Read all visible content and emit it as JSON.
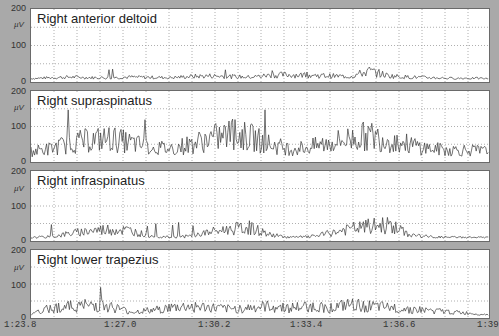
{
  "chart_data": {
    "type": "line",
    "title": "",
    "xlabel": "",
    "ylabel": "µV",
    "x_ticks": [
      "1:23.8",
      "1:27.0",
      "1:30.2",
      "1:33.4",
      "1:36.6",
      "1:39"
    ],
    "ylim": [
      0,
      200
    ],
    "y_ticks": [
      "0",
      "100",
      "200"
    ],
    "grid": true,
    "series": [
      {
        "name": "Right anterior deltoid",
        "baseline": 5,
        "envelope": [
          5,
          8,
          10,
          8,
          8,
          10,
          9,
          8,
          12,
          14,
          12,
          10,
          16,
          18,
          16,
          14,
          12,
          30,
          14,
          10,
          8,
          6,
          6,
          5
        ],
        "peak": 35
      },
      {
        "name": "Right supraspinatus",
        "baseline": 40,
        "envelope": [
          30,
          40,
          60,
          70,
          75,
          60,
          45,
          40,
          55,
          75,
          90,
          80,
          55,
          40,
          45,
          60,
          75,
          85,
          70,
          55,
          40,
          35,
          35,
          30
        ],
        "peak": 180
      },
      {
        "name": "Right infraspinatus",
        "baseline": 5,
        "envelope": [
          5,
          8,
          20,
          30,
          35,
          30,
          10,
          6,
          10,
          25,
          35,
          40,
          15,
          6,
          8,
          20,
          35,
          45,
          50,
          15,
          8,
          6,
          6,
          5
        ],
        "peak": 60
      },
      {
        "name": "Right lower trapezius",
        "baseline": 15,
        "envelope": [
          5,
          30,
          35,
          40,
          35,
          15,
          20,
          30,
          35,
          30,
          25,
          30,
          35,
          30,
          35,
          30,
          40,
          35,
          30,
          25,
          20,
          15,
          10,
          5
        ],
        "peak": 95
      }
    ]
  },
  "panels": [
    {
      "title": "Right anterior deltoid",
      "y200": "200",
      "unit": "µV",
      "y100": "100",
      "y0": "0"
    },
    {
      "title": "Right supraspinatus",
      "y200": "200",
      "unit": "µV",
      "y100": "100",
      "y0": "0"
    },
    {
      "title": "Right infraspinatus",
      "y200": "200",
      "unit": "µV",
      "y100": "100",
      "y0": "0"
    },
    {
      "title": "Right lower trapezius",
      "y200": "200",
      "unit": "µV",
      "y100": "100",
      "y0": "0"
    }
  ],
  "x_axis": {
    "ticks": [
      "1:23.8",
      "1:27.0",
      "1:30.2",
      "1:33.4",
      "1:36.6",
      "1:39"
    ]
  }
}
